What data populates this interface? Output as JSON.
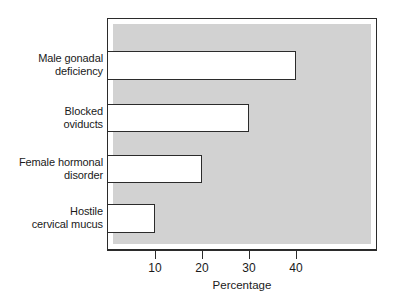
{
  "chart_data": {
    "type": "bar",
    "orientation": "horizontal",
    "title": "",
    "subtitle": "",
    "xlabel": "Percentage",
    "ylabel": "",
    "categories": [
      "Male gonadal\ndeficiency",
      "Blocked\noviducts",
      "Female hormonal\ndisorder",
      "Hostile\ncervical mucus"
    ],
    "values": [
      40,
      30,
      20,
      10
    ],
    "xlim": [
      0,
      50
    ],
    "xticks": [
      10,
      20,
      30,
      40
    ],
    "xtick_labels": [
      "10",
      "20",
      "30",
      "40"
    ],
    "grid": false,
    "legend": null,
    "legend_position": "none",
    "bar_fill_color": "#ffffff",
    "bar_edge_color": "#2b2b2b",
    "plot_background_color": "#d2d2d2",
    "figure_background_color": "#ffffff",
    "frame_color": "#2b2b2b"
  },
  "axis": {
    "x_title": "Percentage",
    "ticks": [
      {
        "label": "10",
        "value": 10
      },
      {
        "label": "20",
        "value": 20
      },
      {
        "label": "30",
        "value": 30
      },
      {
        "label": "40",
        "value": 40
      }
    ]
  },
  "bars": [
    {
      "label_line1": "Male gonadal",
      "label_line2": "deficiency",
      "value": 40
    },
    {
      "label_line1": "Blocked",
      "label_line2": "oviducts",
      "value": 30
    },
    {
      "label_line1": "Female hormonal",
      "label_line2": "disorder",
      "value": 20
    },
    {
      "label_line1": "Hostile",
      "label_line2": "cervical mucus",
      "value": 10
    }
  ]
}
